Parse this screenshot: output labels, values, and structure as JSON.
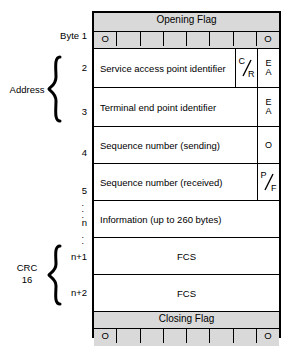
{
  "diagram": {
    "colors": {
      "flag_fill": "#d9d9d9",
      "field_fill": "#ffffff",
      "line": "#000000"
    },
    "gutter": {
      "byte_label": "Byte 1",
      "row_numbers": [
        "2",
        "3",
        "4",
        "5",
        "n",
        "n+1",
        "n+2"
      ],
      "groups": [
        {
          "label": "Address"
        },
        {
          "label_line1": "CRC",
          "label_line2": "16"
        }
      ],
      "ellipsis_dot": "."
    },
    "flags": {
      "opening": {
        "title": "Opening Flag",
        "bits": [
          "O",
          "",
          "",
          "",
          "",
          "",
          "",
          "O"
        ]
      },
      "closing": {
        "title": "Closing Flag",
        "bits": [
          "O",
          "",
          "",
          "",
          "",
          "",
          "",
          "O"
        ]
      }
    },
    "rows": [
      {
        "name": "sapi",
        "label": "Service access point identifier",
        "bit1": {
          "num": "C",
          "den": "R"
        },
        "bit2": {
          "top": "E",
          "bottom": "A"
        }
      },
      {
        "name": "tei",
        "label": "Terminal end point identifier",
        "bit2": {
          "top": "E",
          "bottom": "A"
        }
      },
      {
        "name": "ns",
        "label": "Sequence number (sending)",
        "bit2": {
          "single": "O"
        }
      },
      {
        "name": "nr",
        "label": "Sequence number (received)",
        "bit2": {
          "num": "P",
          "den": "F"
        }
      },
      {
        "name": "information",
        "label": "Information (up to 260 bytes)"
      },
      {
        "name": "fcs-1",
        "label": "FCS"
      },
      {
        "name": "fcs-2",
        "label": "FCS"
      }
    ]
  }
}
